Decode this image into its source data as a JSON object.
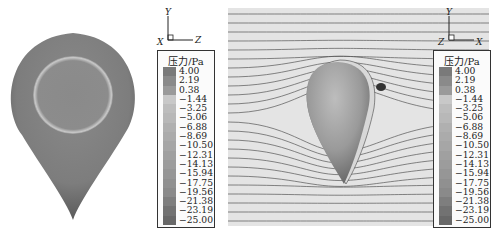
{
  "figure": {
    "left_panel": {
      "description": "gray teardrop body, surface pressure contour",
      "axes": {
        "y": "Y",
        "x": "X",
        "z": "Z"
      },
      "colorbar": {
        "title": "压力/Pa",
        "levels": [
          "4.00",
          "2.19",
          "0.38",
          "−1.44",
          "−3.25",
          "−5.06",
          "−6.88",
          "−8.69",
          "−10.50",
          "−12.31",
          "−14.13",
          "−15.94",
          "−17.75",
          "−19.56",
          "−21.38",
          "−23.19",
          "−25.00"
        ],
        "colors": [
          "#7a7a7a",
          "#8a8a8a",
          "#9a9a9a",
          "#c8c8c8",
          "#bdbdbd",
          "#b8b8b8",
          "#b0b0b0",
          "#ababab",
          "#a6a6a6",
          "#a0a0a0",
          "#9c9c9c",
          "#969696",
          "#909090",
          "#8a8a8a",
          "#7e7e7e",
          "#727272",
          "#686868"
        ]
      }
    },
    "right_panel": {
      "description": "streamlines around teardrop body with surface pressure",
      "axes": {
        "y": "Y",
        "x": "X",
        "z": "Z"
      },
      "colorbar": {
        "title": "压力/Pa",
        "levels": [
          "4.00",
          "2.19",
          "0.38",
          "−1.44",
          "−3.25",
          "−5.06",
          "−6.88",
          "−8.69",
          "−10.50",
          "−12.31",
          "−14.13",
          "−15.94",
          "−17.75",
          "−19.56",
          "−21.38",
          "−23.19",
          "−25.00"
        ]
      }
    }
  }
}
